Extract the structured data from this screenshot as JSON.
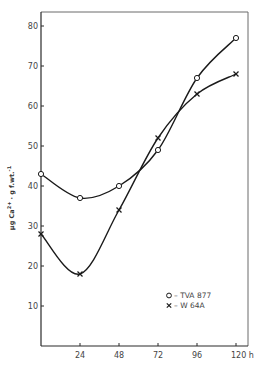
{
  "chart_data": {
    "type": "line",
    "title": "",
    "xlabel": "h",
    "ylabel": "μg Ca2+ · g f.wt.-1",
    "x": [
      0,
      24,
      48,
      72,
      96,
      120
    ],
    "x_tick_labels": [
      "24",
      "48",
      "72",
      "96",
      "120 h"
    ],
    "x_ticks": [
      24,
      48,
      72,
      96,
      120
    ],
    "y_ticks": [
      10,
      20,
      30,
      40,
      50,
      60,
      70,
      80
    ],
    "y_tick_labels": [
      "10",
      "20",
      "30",
      "40",
      "50",
      "60",
      "70",
      "80"
    ],
    "xlim": [
      0,
      126
    ],
    "ylim": [
      0,
      84
    ],
    "grid": false,
    "legend_position": "lower right",
    "series": [
      {
        "name": "TVA 877",
        "marker": "circle",
        "values": [
          43,
          37,
          40,
          49,
          67,
          77
        ]
      },
      {
        "name": "W 64A",
        "marker": "cross",
        "values": [
          28,
          18,
          34,
          52,
          63,
          68
        ]
      }
    ]
  },
  "legend": {
    "items": [
      {
        "symbol": "O",
        "label": "– TVA 877"
      },
      {
        "symbol": "×",
        "label": "– W 64A"
      }
    ]
  },
  "axis": {
    "ylabel_main": "μg Ca",
    "ylabel_sup": "2+",
    "ylabel_rest": "· g f.wt.",
    "ylabel_sup2": "-1"
  }
}
